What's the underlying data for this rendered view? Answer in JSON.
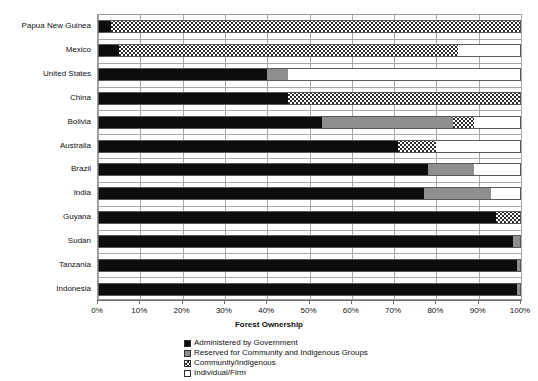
{
  "chart_data": {
    "type": "bar",
    "orientation": "horizontal",
    "stacked": true,
    "stacked_mode": "percent",
    "title": "",
    "xlabel": "Forest Ownership",
    "ylabel": "Countries",
    "xlim": [
      0,
      100
    ],
    "xticks": [
      0,
      10,
      20,
      30,
      40,
      50,
      60,
      70,
      80,
      90,
      100
    ],
    "xtick_labels": [
      "0%",
      "10%",
      "20%",
      "30%",
      "40%",
      "50%",
      "60%",
      "70%",
      "80%",
      "90%",
      "100%"
    ],
    "grid": true,
    "grid_axis": "both",
    "legend_position": "bottom",
    "categories": [
      "Papua New Guinea",
      "Mexico",
      "United States",
      "China",
      "Bolivia",
      "Australia",
      "Brazil",
      "India",
      "Guyana",
      "Sudan",
      "Tanzania",
      "Indonesia"
    ],
    "series": [
      {
        "name": "Administered by Government",
        "color": "#0d0d0d",
        "pattern": "solid",
        "values": [
          3,
          5,
          40,
          45,
          53,
          71,
          78,
          77,
          94,
          98,
          99,
          99
        ]
      },
      {
        "name": "Reserved for Community and Indigenous Groups",
        "color": "#8e8e8e",
        "pattern": "solid-gray",
        "values": [
          0,
          0,
          5,
          0,
          31,
          0,
          11,
          16,
          0,
          2,
          1,
          1
        ]
      },
      {
        "name": "Community/Indigenous",
        "color": "#2b2b2b",
        "pattern": "checkered",
        "values": [
          97,
          80,
          0,
          55,
          5,
          9,
          0,
          0,
          6,
          0,
          0,
          0
        ]
      },
      {
        "name": "Individual/Firm",
        "color": "#ffffff",
        "pattern": "empty",
        "values": [
          0,
          15,
          55,
          0,
          11,
          20,
          11,
          7,
          0,
          0,
          0,
          0
        ]
      }
    ]
  },
  "legend": {
    "items": [
      {
        "label": "Administered by Government",
        "swatch": "gov"
      },
      {
        "label": "Reserved for Community and Indigenous Groups",
        "swatch": "reserved"
      },
      {
        "label": "Community/Indigenous",
        "swatch": "community"
      },
      {
        "label": "Individual/Firm",
        "swatch": "individual"
      }
    ]
  },
  "axes": {
    "x_title": "Forest Ownership",
    "y_title": "Countries"
  }
}
